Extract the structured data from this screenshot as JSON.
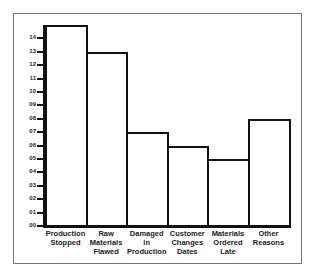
{
  "chart_data": {
    "type": "bar",
    "title": "",
    "xlabel": "",
    "ylabel": "",
    "categories": [
      "Production Stopped",
      "Raw Materials Flawed",
      "Damaged in Production",
      "Customer Changes Dates",
      "Materials Ordered Late",
      "Other Reasons"
    ],
    "category_lines": [
      [
        "Production",
        "Stopped"
      ],
      [
        "Raw",
        "Materials",
        "Flawed"
      ],
      [
        "Damaged",
        "in",
        "Production"
      ],
      [
        "Customer",
        "Changes",
        "Dates"
      ],
      [
        "Materials",
        "Ordered",
        "Late"
      ],
      [
        "Other",
        "Reasons"
      ]
    ],
    "values": [
      15,
      13,
      7,
      6,
      5,
      8
    ],
    "ylim": [
      0,
      15
    ],
    "yticks": [
      "00",
      "01",
      "02",
      "03",
      "04",
      "05",
      "06",
      "07",
      "08",
      "09",
      "10",
      "11",
      "12",
      "13",
      "14"
    ],
    "grid": false,
    "legend": null
  }
}
